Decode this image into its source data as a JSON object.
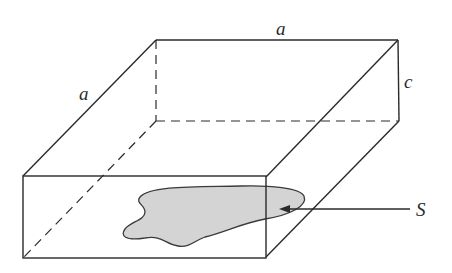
{
  "figure": {
    "type": "rectangular box diagram",
    "labels": {
      "top_edge": "a",
      "left_edge": "a",
      "height": "c",
      "surface": "S"
    },
    "colors": {
      "line": "#2a2a2a",
      "surface_fill": "#d4d4d4",
      "background": "#ffffff"
    }
  }
}
